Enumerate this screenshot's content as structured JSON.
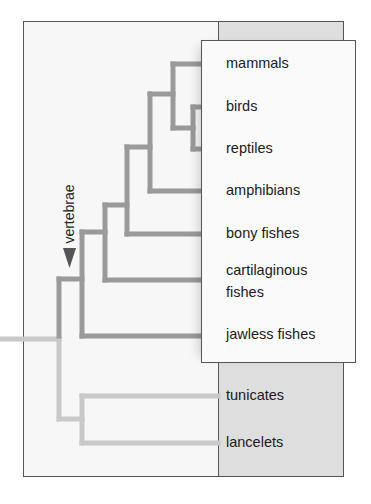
{
  "diagram": {
    "type": "phylogenetic-tree",
    "annotation": {
      "label": "vertebrae",
      "marker": "down-arrow"
    },
    "vertebrate_taxa": [
      {
        "label": "mammals"
      },
      {
        "label": "birds"
      },
      {
        "label": "reptiles"
      },
      {
        "label": "amphibians"
      },
      {
        "label": "bony fishes"
      },
      {
        "label": "cartilaginous",
        "label_line2": "fishes"
      },
      {
        "label": "jawless fishes"
      }
    ],
    "invertebrate_taxa": [
      {
        "label": "tunicates"
      },
      {
        "label": "lancelets"
      }
    ],
    "colors": {
      "vertebrate_branch": "#9a9a9a",
      "invertebrate_branch": "#c9c9c9",
      "arrow": "#555555",
      "gray_panel": "#dedede",
      "frame_border": "#555555"
    }
  }
}
